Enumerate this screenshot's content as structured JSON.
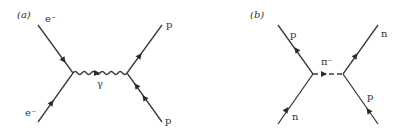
{
  "figure": {
    "panels": [
      {
        "id": "a",
        "label": "(a)",
        "left_top": "e⁻",
        "left_bottom": "e⁻",
        "propagator": "γ",
        "propagator_type": "wavy-photon",
        "right_top": "p",
        "right_bottom": "p"
      },
      {
        "id": "b",
        "label": "(b)",
        "left_top": "p",
        "left_bottom": "n",
        "propagator": "π⁻",
        "propagator_type": "dashed-meson",
        "right_top": "n",
        "right_bottom": "p"
      }
    ],
    "colors": {
      "line": "#3a3a3a",
      "text": "#333333",
      "background": "#ffffff"
    }
  }
}
